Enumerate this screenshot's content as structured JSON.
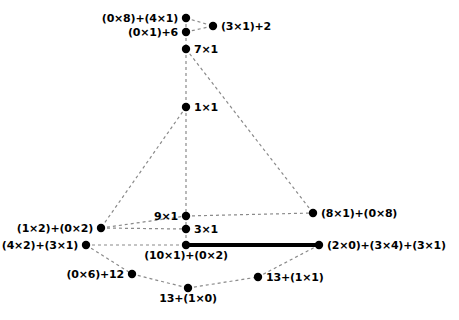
{
  "diagram": {
    "background_color": "#ffffff",
    "node_color": "#000000",
    "edge_color": "#8a8a8a",
    "highlight_edge_color": "#000000",
    "nodes": [
      {
        "id": "n1",
        "label": "(0×8)+(4×1)",
        "x": 186,
        "y": 18,
        "place": "left"
      },
      {
        "id": "n2",
        "label": "(3×1)+2",
        "x": 213,
        "y": 26,
        "place": "right"
      },
      {
        "id": "n3",
        "label": "(0×1)+6",
        "x": 186,
        "y": 32,
        "place": "left"
      },
      {
        "id": "n4",
        "label": "7×1",
        "x": 186,
        "y": 49,
        "place": "right"
      },
      {
        "id": "n5",
        "label": "1×1",
        "x": 186,
        "y": 107,
        "place": "right"
      },
      {
        "id": "n6",
        "label": "9×1",
        "x": 186,
        "y": 216,
        "place": "left"
      },
      {
        "id": "n7",
        "label": "(8×1)+(0×8)",
        "x": 313,
        "y": 213,
        "place": "right"
      },
      {
        "id": "n8",
        "label": "(1×2)+(0×2)",
        "x": 101,
        "y": 228,
        "place": "left"
      },
      {
        "id": "n9",
        "label": "3×1",
        "x": 186,
        "y": 229,
        "place": "right"
      },
      {
        "id": "n10",
        "label": "(4×2)+(3×1)",
        "x": 86,
        "y": 245,
        "place": "left"
      },
      {
        "id": "n11",
        "label": "(10×1)+(0×2)",
        "x": 186,
        "y": 245,
        "place": "below"
      },
      {
        "id": "n12",
        "label": "(2×0)+(3×4)+(3×1)",
        "x": 319,
        "y": 245,
        "place": "right"
      },
      {
        "id": "n13",
        "label": "(0×6)+12",
        "x": 132,
        "y": 274,
        "place": "left"
      },
      {
        "id": "n14",
        "label": "13+(1×1)",
        "x": 258,
        "y": 277,
        "place": "right"
      },
      {
        "id": "n15",
        "label": "13+(1×0)",
        "x": 188,
        "y": 288,
        "place": "below"
      }
    ],
    "edges": [
      {
        "from": "n1",
        "to": "n2",
        "style": "dashed"
      },
      {
        "from": "n3",
        "to": "n2",
        "style": "dashed"
      },
      {
        "from": "n1",
        "to": "n3",
        "style": "dashed"
      },
      {
        "from": "n3",
        "to": "n4",
        "style": "dashed"
      },
      {
        "from": "n4",
        "to": "n5",
        "style": "dashed"
      },
      {
        "from": "n4",
        "to": "n7",
        "style": "dashed"
      },
      {
        "from": "n5",
        "to": "n8",
        "style": "dashed"
      },
      {
        "from": "n5",
        "to": "n6",
        "style": "dashed"
      },
      {
        "from": "n6",
        "to": "n7",
        "style": "dashed"
      },
      {
        "from": "n8",
        "to": "n6",
        "style": "dashed"
      },
      {
        "from": "n8",
        "to": "n9",
        "style": "dashed"
      },
      {
        "from": "n6",
        "to": "n9",
        "style": "dashed"
      },
      {
        "from": "n9",
        "to": "n11",
        "style": "dashed"
      },
      {
        "from": "n10",
        "to": "n11",
        "style": "dashed"
      },
      {
        "from": "n10",
        "to": "n13",
        "style": "dashed"
      },
      {
        "from": "n11",
        "to": "n12",
        "style": "solid-bold"
      },
      {
        "from": "n12",
        "to": "n14",
        "style": "dashed"
      },
      {
        "from": "n13",
        "to": "n15",
        "style": "dashed"
      },
      {
        "from": "n15",
        "to": "n14",
        "style": "dashed"
      }
    ]
  }
}
